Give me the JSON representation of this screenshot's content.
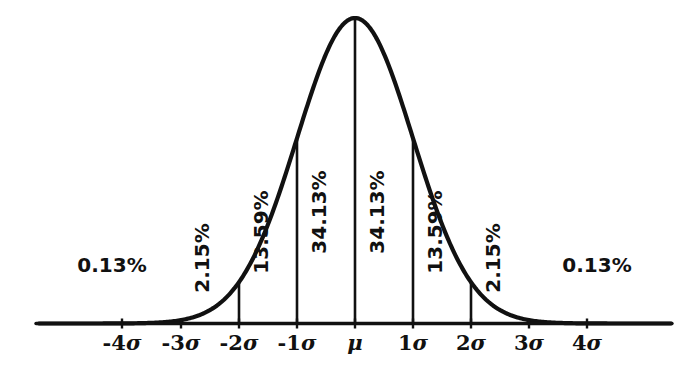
{
  "figure": {
    "kind": "bell-curve-diagram",
    "ink_color": "#111111",
    "background_color": "#ffffff"
  },
  "axis": {
    "name": "sigma-axis",
    "tick_labels": [
      {
        "id": "neg4sigma",
        "text": "-4σ",
        "x": 122
      },
      {
        "id": "neg3sigma",
        "text": "-3σ",
        "x": 181
      },
      {
        "id": "neg2sigma",
        "text": "-2σ",
        "x": 239
      },
      {
        "id": "neg1sigma",
        "text": "-1σ",
        "x": 297
      },
      {
        "id": "mu",
        "text": "μ",
        "x": 355
      },
      {
        "id": "pos1sigma",
        "text": "1σ",
        "x": 413
      },
      {
        "id": "pos2sigma",
        "text": "2σ",
        "x": 471
      },
      {
        "id": "pos3sigma",
        "text": "3σ",
        "x": 529
      },
      {
        "id": "pos4sigma",
        "text": "4σ",
        "x": 587
      }
    ]
  },
  "region_labels": {
    "rotated": [
      {
        "id": "band-neg3-neg2",
        "text": "2.15%",
        "x": 209,
        "y": 258
      },
      {
        "id": "band-neg2-neg1",
        "text": "13.59%",
        "x": 268,
        "y": 232
      },
      {
        "id": "band-neg1-mu",
        "text": "34.13%",
        "x": 326,
        "y": 212
      },
      {
        "id": "band-mu-pos1",
        "text": "34.13%",
        "x": 384,
        "y": 212
      },
      {
        "id": "band-pos1-pos2",
        "text": "13.59%",
        "x": 442,
        "y": 232
      },
      {
        "id": "band-pos2-pos3",
        "text": "2.15%",
        "x": 500,
        "y": 258
      }
    ],
    "horizontal": [
      {
        "id": "tail-left",
        "text": "0.13%",
        "x": 112,
        "y": 272
      },
      {
        "id": "tail-right",
        "text": "0.13%",
        "x": 597,
        "y": 272
      }
    ]
  },
  "chart_data": {
    "type": "area",
    "xlabel": "",
    "ylabel": "",
    "distribution": "normal",
    "mean_label": "μ",
    "sigma_symbol": "σ",
    "grid": false,
    "legend": "none",
    "xlim": [
      -5.45,
      5.45
    ],
    "ylim": [
      0,
      1
    ],
    "x_tick_values": [
      -4,
      -3,
      -2,
      -1,
      0,
      1,
      2,
      3,
      4
    ],
    "x_tick_labels": [
      "-4σ",
      "-3σ",
      "-2σ",
      "-1σ",
      "μ",
      "1σ",
      "2σ",
      "3σ",
      "4σ"
    ],
    "bands": [
      {
        "from": "-∞",
        "to": "-3σ",
        "label": "0.13%",
        "value": 0.13,
        "shaded": true,
        "orientation": "horizontal"
      },
      {
        "from": "-3σ",
        "to": "-2σ",
        "label": "2.15%",
        "value": 2.15,
        "shaded": false,
        "orientation": "rotated"
      },
      {
        "from": "-2σ",
        "to": "-1σ",
        "label": "13.59%",
        "value": 13.59,
        "shaded": false,
        "orientation": "rotated"
      },
      {
        "from": "-1σ",
        "to": "μ",
        "label": "34.13%",
        "value": 34.13,
        "shaded": false,
        "orientation": "rotated"
      },
      {
        "from": "μ",
        "to": "1σ",
        "label": "34.13%",
        "value": 34.13,
        "shaded": false,
        "orientation": "rotated"
      },
      {
        "from": "1σ",
        "to": "2σ",
        "label": "13.59%",
        "value": 13.59,
        "shaded": false,
        "orientation": "rotated"
      },
      {
        "from": "2σ",
        "to": "3σ",
        "label": "2.15%",
        "value": 2.15,
        "shaded": false,
        "orientation": "rotated"
      },
      {
        "from": "3σ",
        "to": "+∞",
        "label": "0.13%",
        "value": 0.13,
        "shaded": true,
        "orientation": "horizontal"
      }
    ],
    "values": [
      0.13,
      2.15,
      13.59,
      34.13,
      34.13,
      13.59,
      2.15,
      0.13
    ],
    "categories": [
      "0.13%",
      "2.15%",
      "13.59%",
      "34.13%",
      "34.13%",
      "13.59%",
      "2.15%",
      "0.13%"
    ]
  }
}
